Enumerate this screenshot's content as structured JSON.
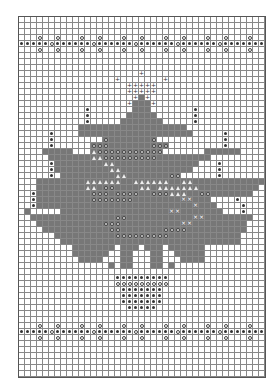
{
  "chart_title": "",
  "grid": {
    "columns": 41,
    "rows": 60,
    "cell_px": 6
  },
  "legend": {
    ".": "empty",
    "#": "dark fill",
    "*": "dot",
    "o": "ring",
    "+": "plus",
    "A": "triangle",
    "x": "cross on dark",
    "O": "ring on dark"
  },
  "colors": {
    "fill": "#777777",
    "grid": "#888888",
    "symbol": "#333333"
  },
  "chart_data": {
    "type": "table",
    "rows": [
      ".........................................",
      ".........................................",
      ".........................................",
      "...o..o...o..o...o..o...o..o...o..o...o..",
      "*****o******o******o******o******o*******",
      "...o..o...o..o...o..o...o..o...o..o...o..",
      ".........................................",
      ".........................................",
      ".........................................",
      "....................+....................",
      "................+.......+................",
      "..................+++++..................",
      "..................+++++..................",
      "...................+#+...................",
      "..................+###+..................",
      "...........*.......###.......*...........",
      "...........*......#####......*...........",
      "...........*.....#######.....*...........",
      "..........##################.............",
      ".....*....###################.....*......",
      ".....*........O#######O...........*......",
      ".....*......OOO#######OOO.........*......",
      "....#####...AOOOOOOOOOOO.......######....",
      ".....#######AAOOOOOOOOO#########.........",
      ".....*########AA##############...*.......",
      ".....*#########AA############....*.......",
      ".....*.#########AA#######OO......*.......",
      "...########AAAAAA##AAAAAA##AA############",
      "...########AA#OO####AA#AAAAAAA##########.",
      "..*#########OOO#OOOO##OOOAAA##OO#######..",
      "..*#########OOOOOOO########xx###....*....",
      "..*##########################x###....*...",
      ".#.....##################xx#######...*...",
      "..##############OO###########xx########..",
      "...###########OOO##########xx#########...",
      "....###########OO#######OOOO##########...",
      "......##########OOOOOOOOO############....",
      ".......##############################....",
      ".........#######.###.###.######..........",
      ".........######..##...##..#####..........",
      "..........####...##...##...####..........",
      "...............#.##...##.#...............",
      ".........................................",
      "................*********................",
      "................ooooooooo................",
      ".................*******.................",
      ".................*******.................",
      ".................*******.................",
      "..................*****..................",
      ".........................................",
      ".........................................",
      "...o..o...o..o...o..o...o..o...o..o...o..",
      "*****o******o******o******o******o*******",
      "...o..o...o..o...o..o...o..o...o..o...o..",
      ".........................................",
      ".........................................",
      ".........................................",
      ".........................................",
      ".........................................",
      "........................................."
    ],
    "xlabel": "",
    "ylabel": ""
  }
}
